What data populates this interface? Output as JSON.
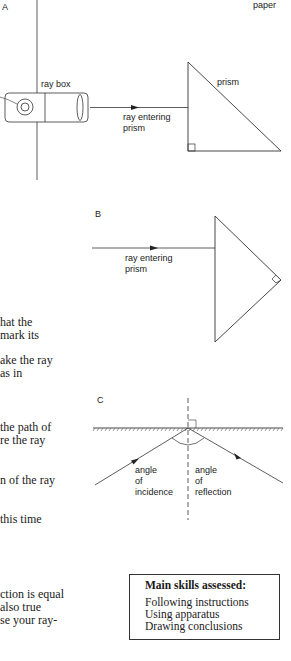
{
  "diagram_a": {
    "label": "A",
    "paper_label": "paper",
    "ray_box_label": "ray box",
    "ray_label_line1": "ray entering",
    "ray_label_line2": "prism",
    "prism_label": "prism"
  },
  "diagram_b": {
    "label": "B",
    "ray_label_line1": "ray entering",
    "ray_label_line2": "prism"
  },
  "diagram_c": {
    "label": "C",
    "incidence_line1": "angle",
    "incidence_line2": "of",
    "incidence_line3": "incidence",
    "reflection_line1": "angle",
    "reflection_line2": "of",
    "reflection_line3": "reflection"
  },
  "body_text": [
    "hat the",
    "mark its",
    "ake the ray",
    " as in",
    " the path of",
    "re the ray",
    "n of the ray",
    "this time",
    "ction is equal",
    " also true",
    "se your ray-"
  ],
  "skills_box": {
    "title": "Main skills assessed:",
    "items": [
      "Following instructions",
      "Using apparatus",
      "Drawing conclusions"
    ]
  }
}
